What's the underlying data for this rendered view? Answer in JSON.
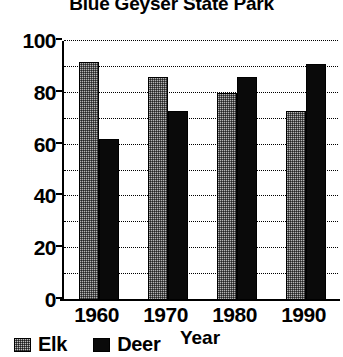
{
  "chart_data": {
    "type": "bar",
    "title": "Blue Geyser State Park",
    "xlabel": "Year",
    "ylabel": "",
    "categories": [
      "1960",
      "1970",
      "1980",
      "1990"
    ],
    "series": [
      {
        "name": "Elk",
        "values": [
          92,
          86,
          80,
          73
        ],
        "swatch": "dithered-gray",
        "color": "#b5b5b5"
      },
      {
        "name": "Deer",
        "values": [
          62,
          73,
          86,
          91
        ],
        "swatch": "solid-black",
        "color": "#0a0a0a"
      }
    ],
    "ylim": [
      0,
      100
    ],
    "ytick_labels": [
      "0",
      "20",
      "40",
      "60",
      "80",
      "100"
    ],
    "ytick_values": [
      0,
      20,
      40,
      60,
      80,
      100
    ],
    "minor_gridline_step": 10,
    "grid": true,
    "grid_style": "dotted",
    "legend_position": "bottom-left",
    "legend_entries": [
      "Elk",
      "Deer"
    ]
  }
}
